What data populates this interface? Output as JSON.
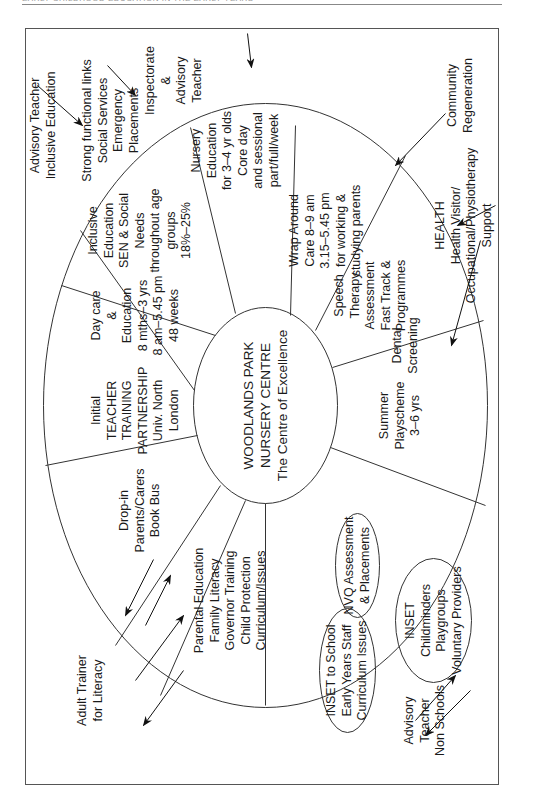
{
  "page_header": {
    "text": "EARLY CHILDHOOD EDUCATION IN THE EARLY YEARS"
  },
  "diagram": {
    "center": {
      "line1": "WOODLANDS PARK",
      "line2": "NURSERY CENTRE",
      "line3": "The Centre of Excellence"
    },
    "segments": [
      {
        "id": "day-care",
        "lines": [
          "Day care",
          "&",
          "Education",
          "8 mths–3 yrs",
          "8 am–5.45 pm",
          "48 weeks"
        ]
      },
      {
        "id": "inclusive-education",
        "lines": [
          "Inclusive",
          "Education",
          "SEN & Social",
          "Needs",
          "throughout age",
          "groups",
          "18%–25%"
        ]
      },
      {
        "id": "nursery-education",
        "lines": [
          "Nursery",
          "Education",
          "for 3–4 yr olds",
          "Core day",
          "and sessional",
          "part/full/week"
        ]
      },
      {
        "id": "wrap-around-care",
        "lines": [
          "Wrap Around",
          "Care 8–9 am",
          "3.15–5.45 pm",
          "for working &",
          "studying parents"
        ]
      },
      {
        "id": "speech-therapy",
        "lines": [
          "Speech",
          "Therapy",
          "Assessment",
          "Fast Track &",
          "Programmes"
        ]
      },
      {
        "id": "dental-screening",
        "lines": [
          "Dental",
          "Screening"
        ]
      },
      {
        "id": "summer-playscheme",
        "lines": [
          "Summer",
          "Playscheme",
          "3–6 yrs"
        ]
      },
      {
        "id": "parental-education",
        "lines": [
          "Parental Education",
          "Family Literacy",
          "Governor Training",
          "Child Protection",
          "Curriculum/Issues"
        ]
      },
      {
        "id": "drop-in",
        "lines": [
          "Drop-in",
          "Parents/Carers",
          "Book Bus"
        ]
      },
      {
        "id": "teacher-training",
        "lines": [
          "Initial",
          "TEACHER",
          "TRAINING",
          "PARTNERSHIP",
          "Univ. North",
          "London"
        ]
      }
    ],
    "ovals": [
      {
        "id": "inset-school",
        "lines": [
          "INSET to School",
          "Early Years Staff",
          "Curriculum Issues"
        ]
      },
      {
        "id": "nvq",
        "lines": [
          "NVQ Assessment",
          "& Placements"
        ]
      },
      {
        "id": "inset-childminders",
        "lines": [
          "INSET",
          "Childminders",
          "Playgroups",
          "Voluntary Providers"
        ]
      }
    ],
    "external": [
      {
        "id": "advisory-inclusive",
        "lines": [
          "Advisory Teacher",
          "Inclusive Education"
        ]
      },
      {
        "id": "social-services",
        "lines": [
          "Strong functional links",
          "Social Services",
          "Emergency",
          "Placements"
        ]
      },
      {
        "id": "inspectorate",
        "lines": [
          "Inspectorate",
          "&",
          "Advisory",
          "Teacher"
        ]
      },
      {
        "id": "community",
        "lines": [
          "Community",
          "Regeneration"
        ]
      },
      {
        "id": "health",
        "lines": [
          "HEALTH",
          "Health Visitor/",
          "Occupational/Physiotherapy",
          "Support"
        ]
      },
      {
        "id": "advisory-non-schools",
        "lines": [
          "Advisory",
          "Teacher",
          "Non Schools"
        ]
      },
      {
        "id": "adult-trainer",
        "lines": [
          "Adult Trainer",
          "for Literacy"
        ]
      }
    ]
  }
}
